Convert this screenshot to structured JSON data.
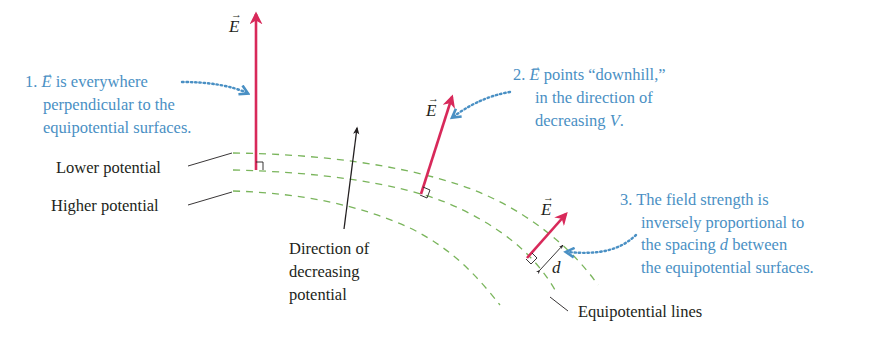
{
  "diagram": {
    "type": "electric-field-equipotential",
    "colors": {
      "field_vector": "#d8295a",
      "equipotential": "#7ab55c",
      "annotation": "#4a90c4",
      "text": "#231f20"
    },
    "vector_symbol": "E",
    "vector_arrow": "→",
    "labels": {
      "lower_potential": "Lower potential",
      "higher_potential": "Higher potential",
      "direction_line1": "Direction of",
      "direction_line2": "decreasing",
      "direction_line3": "potential",
      "equipotential_lines": "Equipotential lines",
      "spacing": "d"
    },
    "notes": [
      {
        "number": "1.",
        "symbol": "E",
        "line1_rest": " is everywhere",
        "line2": "perpendicular to the",
        "line3": "equipotential surfaces."
      },
      {
        "number": "2.",
        "symbol": "E",
        "line1_rest": " points “downhill,”",
        "line2": "in the direction of",
        "line3_prefix": "decreasing ",
        "line3_var": "V",
        "line3_suffix": "."
      },
      {
        "number": "3.",
        "line1": "The field strength is",
        "line2": "inversely proportional to",
        "line3_prefix": "the spacing ",
        "line3_var": "d",
        "line3_suffix": " between",
        "line4": "the equipotential surfaces."
      }
    ]
  }
}
